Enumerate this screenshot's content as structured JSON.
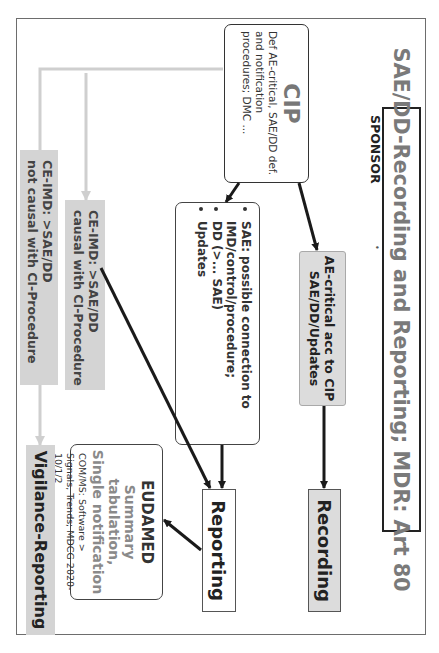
{
  "diagram": {
    "title": "SAE/DD-Recording and Reporting; MDR: Art 80",
    "sponsor_label": "SPONSOR",
    "bullet_mark": "•",
    "orientation": "rotated 90° clockwise",
    "nodes": {
      "cip": {
        "title": "CIP",
        "text": "Def AE-critical, SAE/DD def. and notification procedures; DMC ..."
      },
      "ae_critical": {
        "line1": "AE-critical acc to CIP",
        "line2": "SAE/DD/Updates"
      },
      "recording": {
        "label": "Recording"
      },
      "sae_box": {
        "items": [
          "SAE: possible connection to IMD/control/procedure;",
          "DD (>... SAE)",
          "Updates"
        ]
      },
      "reporting": {
        "label": "Reporting"
      },
      "eudamed": {
        "title": "EUDAMED",
        "sub1": "Summary tabulation,",
        "sub2": "Single notification",
        "note": "COM/MS: Software > Signals, Trends; MDCG 2020-10/1/2"
      },
      "ce_causal": {
        "line1": "CE-IMD: >SAE/DD",
        "line2": "causal with CI-Procedure"
      },
      "ce_not_causal": {
        "line1": "CE-IMD: >SAE/DD",
        "line2": "not causal with CI-Procedure"
      },
      "vigilance": {
        "label": "Vigilance-Reporting"
      }
    },
    "edges": [
      {
        "from": "cip",
        "to": "ae_critical",
        "color": "#1a1a1a"
      },
      {
        "from": "cip",
        "to": "sae_box",
        "color": "#1a1a1a"
      },
      {
        "from": "ae_critical",
        "to": "recording",
        "color": "#1a1a1a"
      },
      {
        "from": "sae_box",
        "to": "reporting",
        "color": "#1a1a1a"
      },
      {
        "from": "ce_causal",
        "to": "reporting",
        "color": "#1a1a1a"
      },
      {
        "from": "reporting",
        "to": "eudamed",
        "color": "#1a1a1a"
      },
      {
        "from": "cip",
        "to": "ce_causal",
        "color": "#cfcfcf"
      },
      {
        "from": "cip",
        "to": "ce_not_causal",
        "color": "#cfcfcf"
      },
      {
        "from": "ce_not_causal",
        "to": "vigilance",
        "color": "#cfcfcf"
      }
    ],
    "colors": {
      "title_text": "#7a7a7a",
      "gray_box": "#dcdcdc",
      "light_connector": "#cfcfcf",
      "dark_connector": "#1a1a1a"
    }
  }
}
